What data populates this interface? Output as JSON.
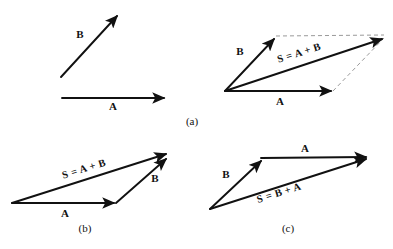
{
  "figure": {
    "title_visible": false,
    "background_color": "#ffffff",
    "stroke_color": "#111111",
    "dashed_color": "#9a9a9a",
    "panels": [
      {
        "id": "a",
        "caption": "(a)",
        "caption_x": 192,
        "caption_y": 125,
        "groups": [
          {
            "id": "a-separate",
            "description": "separate vectors A and B before addition",
            "vectors": [
              {
                "name": "B",
                "label": "B",
                "label_x": 80,
                "label_y": 38,
                "x1": 61,
                "y1": 77,
                "x2": 119,
                "y2": 14,
                "style": "solid"
              },
              {
                "name": "A",
                "label": "A",
                "label_x": 113,
                "label_y": 110,
                "x1": 62,
                "y1": 98,
                "x2": 166,
                "y2": 98,
                "style": "solid"
              }
            ],
            "dashed": []
          },
          {
            "id": "a-parallelogram",
            "description": "parallelogram construction of S = A + B",
            "vectors": [
              {
                "name": "B",
                "label": "B",
                "label_x": 240,
                "label_y": 55,
                "x1": 225,
                "y1": 91,
                "x2": 276,
                "y2": 37,
                "style": "solid"
              },
              {
                "name": "A",
                "label": "A",
                "label_x": 280,
                "label_y": 105,
                "x1": 225,
                "y1": 91,
                "x2": 333,
                "y2": 91,
                "style": "solid"
              },
              {
                "name": "S",
                "label": "S = A + B",
                "label_x": 300,
                "label_y": 56,
                "label_rotation": -17.5,
                "x1": 225,
                "y1": 91,
                "x2": 384,
                "y2": 38,
                "style": "solid"
              }
            ],
            "dashed": [
              {
                "name": "dash-top",
                "x1": 276,
                "y1": 36,
                "x2": 384,
                "y2": 35
              },
              {
                "name": "dash-right",
                "x1": 333,
                "y1": 91,
                "x2": 384,
                "y2": 38
              }
            ]
          }
        ]
      },
      {
        "id": "b",
        "caption": "(b)",
        "caption_x": 85,
        "caption_y": 232,
        "groups": [
          {
            "id": "b-triangle",
            "description": "head to tail: A then B giving S = A + B",
            "vectors": [
              {
                "name": "A",
                "label": "A",
                "label_x": 65,
                "label_y": 217,
                "x1": 12,
                "y1": 203,
                "x2": 116,
                "y2": 203,
                "style": "solid"
              },
              {
                "name": "B",
                "label": "B",
                "label_x": 155,
                "label_y": 182,
                "x1": 116,
                "y1": 203,
                "x2": 168,
                "y2": 157,
                "style": "solid"
              },
              {
                "name": "S",
                "label": "S = A + B",
                "label_x": 85,
                "label_y": 172,
                "label_rotation": -17.0,
                "x1": 12,
                "y1": 203,
                "x2": 168,
                "y2": 153,
                "style": "solid"
              }
            ],
            "dashed": []
          }
        ]
      },
      {
        "id": "c",
        "caption": "(c)",
        "caption_x": 288,
        "caption_y": 232,
        "groups": [
          {
            "id": "c-triangle",
            "description": "head to tail: B then A giving S = B + A",
            "vectors": [
              {
                "name": "B",
                "label": "B",
                "label_x": 226,
                "label_y": 178,
                "x1": 210,
                "y1": 209,
                "x2": 263,
                "y2": 159,
                "style": "solid"
              },
              {
                "name": "A",
                "label": "A",
                "label_x": 305,
                "label_y": 152,
                "x1": 261,
                "y1": 158,
                "x2": 368,
                "y2": 157,
                "style": "solid"
              },
              {
                "name": "S",
                "label": "S = B + A",
                "label_x": 280,
                "label_y": 196,
                "label_rotation": -17.5,
                "x1": 210,
                "y1": 209,
                "x2": 368,
                "y2": 158,
                "style": "solid"
              }
            ],
            "dashed": []
          }
        ]
      }
    ]
  }
}
